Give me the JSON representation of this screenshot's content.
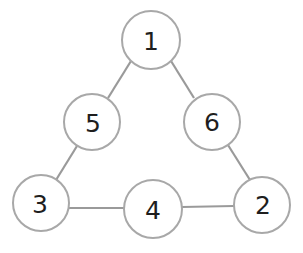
{
  "diagram": {
    "type": "triangle-number-graph",
    "nodes": [
      {
        "id": "n1",
        "label": "1",
        "cx": 151,
        "cy": 40,
        "r": 29
      },
      {
        "id": "n5",
        "label": "5",
        "cx": 92,
        "cy": 122,
        "r": 28
      },
      {
        "id": "n6",
        "label": "6",
        "cx": 212,
        "cy": 122,
        "r": 28
      },
      {
        "id": "n3",
        "label": "3",
        "cx": 41,
        "cy": 203,
        "r": 28
      },
      {
        "id": "n4",
        "label": "4",
        "cx": 153,
        "cy": 209,
        "r": 29
      },
      {
        "id": "n2",
        "label": "2",
        "cx": 262,
        "cy": 205,
        "r": 28
      }
    ],
    "edges": [
      {
        "from": "n1",
        "to": "n5"
      },
      {
        "from": "n1",
        "to": "n6"
      },
      {
        "from": "n5",
        "to": "n3"
      },
      {
        "from": "n6",
        "to": "n2"
      },
      {
        "from": "n3",
        "to": "n4"
      },
      {
        "from": "n4",
        "to": "n2"
      }
    ]
  }
}
